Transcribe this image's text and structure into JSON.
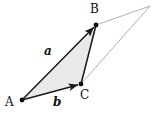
{
  "figure": {
    "kind": "vector-triangle-diagram",
    "width": 157,
    "height": 119,
    "background_color": "#ffffff"
  },
  "colors": {
    "stroke_dark": "#1a1a1a",
    "stroke_light": "#9a9a9a",
    "triangle_fill": "#e9e9e9",
    "vertex_dot": "#111111",
    "text": "#111111"
  },
  "points": {
    "A": {
      "label": "A",
      "x": 22,
      "y": 100
    },
    "B": {
      "label": "B",
      "x": 96,
      "y": 25
    },
    "C": {
      "label": "C",
      "x": 81,
      "y": 84
    },
    "D": {
      "label": "",
      "x": 150,
      "y": 6
    }
  },
  "labels": {
    "A": "A",
    "B": "B",
    "C": "C",
    "vector_a": "a",
    "vector_b": "b"
  },
  "shapes": {
    "shaded_triangle": {
      "name": "triangle-ABC",
      "vertices": "A,B,C",
      "fill": "#e9e9e9"
    },
    "outline_triangle": {
      "name": "triangle-BCD",
      "vertices": "B,C,D",
      "fill": "none",
      "stroke": "#9a9a9a"
    }
  },
  "vectors": [
    {
      "name": "a",
      "from": "A",
      "to": "B",
      "label": "a",
      "arrowhead": true
    },
    {
      "name": "b",
      "from": "A",
      "to": "C",
      "label": "b",
      "arrowhead": true
    }
  ],
  "chart_data": {
    "type": "scatter",
    "title": "",
    "xlabel": "",
    "ylabel": "",
    "series": [
      {
        "name": "vertices",
        "points": [
          {
            "label": "A",
            "x": 22,
            "y": 100
          },
          {
            "label": "B",
            "x": 96,
            "y": 25
          },
          {
            "label": "C",
            "x": 81,
            "y": 84
          },
          {
            "label": "D",
            "x": 150,
            "y": 6
          }
        ]
      }
    ],
    "annotations": [
      "A",
      "B",
      "C",
      "a",
      "b"
    ],
    "grid": false,
    "legend": "none"
  }
}
